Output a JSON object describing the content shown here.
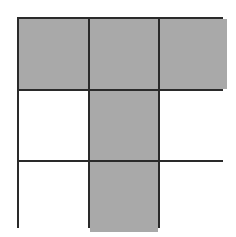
{
  "diagram": {
    "type": "grid",
    "rows": 3,
    "cols": 3,
    "colors": {
      "shaded": "#a9a9a9",
      "empty": "#ffffff",
      "line": "#2a2a2a"
    },
    "cells": [
      [
        true,
        true,
        true
      ],
      [
        false,
        true,
        false
      ],
      [
        false,
        true,
        false
      ]
    ]
  }
}
